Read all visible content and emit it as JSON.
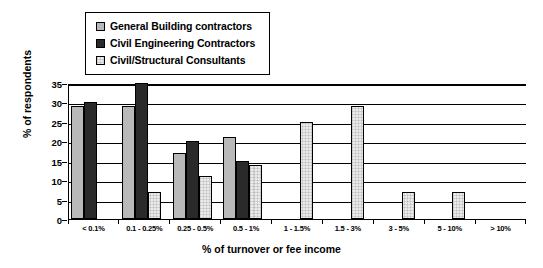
{
  "chart_data": {
    "type": "bar",
    "title": "",
    "xlabel": "% of turnover or fee income",
    "ylabel": "% of respondents",
    "ylim": [
      0,
      35
    ],
    "ytick_step": 5,
    "yticks": [
      0,
      5,
      10,
      15,
      20,
      25,
      30,
      35
    ],
    "grid": true,
    "legend_position": "top-left",
    "categories": [
      "< 0.1%",
      "0.1 - 0.25%",
      "0.25 - 0.5%",
      "0.5 - 1%",
      "1 - 1.5%",
      "1.5 - 3%",
      "3 - 5%",
      "5 - 10%",
      "> 10%"
    ],
    "series": [
      {
        "name": "General Building contractors",
        "fill": "gray-checker",
        "color": "#b9b9b9",
        "values": [
          29,
          29,
          17,
          21,
          0,
          0,
          0,
          0,
          0
        ]
      },
      {
        "name": "Civil Engineering Contractors",
        "fill": "dark-checker",
        "color": "#2a2a2a",
        "values": [
          30,
          35,
          20,
          15,
          0,
          0,
          0,
          0,
          0
        ]
      },
      {
        "name": "Civil/Structural Consultants",
        "fill": "white",
        "color": "#ebebeb",
        "values": [
          0,
          7,
          11,
          14,
          25,
          29,
          7,
          7,
          0
        ]
      }
    ]
  },
  "legend": {
    "items": [
      {
        "label": "General Building contractors",
        "swatch": "gray-checker"
      },
      {
        "label": "Civil Engineering Contractors",
        "swatch": "dark-checker"
      },
      {
        "label": "Civil/Structural Consultants",
        "swatch": "white"
      }
    ]
  },
  "axes": {
    "y_title": "% of respondents",
    "x_title": "% of turnover or fee income"
  }
}
